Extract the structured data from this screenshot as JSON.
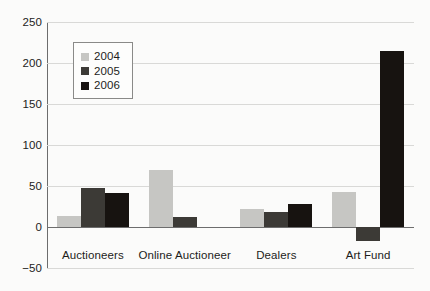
{
  "chart_data": {
    "type": "bar",
    "title": "",
    "subtitle": "",
    "xlabel": "",
    "ylabel": "",
    "categories": [
      "Auctioneers",
      "Online Auctioneer",
      "Dealers",
      "Art Fund"
    ],
    "series": [
      {
        "name": "2004",
        "color": "#c6c6c3",
        "values": [
          13,
          69,
          22,
          43
        ]
      },
      {
        "name": "2005",
        "color": "#3c3a36",
        "values": [
          48,
          12,
          18,
          -17
        ]
      },
      {
        "name": "2006",
        "color": "#171310",
        "values": [
          41,
          0,
          28,
          215
        ]
      }
    ],
    "ylim": [
      -50,
      250
    ],
    "yticks": [
      250,
      200,
      150,
      100,
      50,
      0,
      -50
    ],
    "ytick_labels": [
      "250",
      "200",
      "150",
      "100",
      "50",
      "0",
      "−50"
    ],
    "grid": true,
    "legend_position": "top-left-inside"
  },
  "legend": {
    "entries": [
      {
        "label": "2004",
        "color": "#c6c6c3"
      },
      {
        "label": "2005",
        "color": "#3c3a36"
      },
      {
        "label": "2006",
        "color": "#171310"
      }
    ]
  },
  "axes": {
    "zero_line_color": "#6d6d6d",
    "grid_color": "#d9d9d7",
    "text_color": "#1d1d1b"
  }
}
